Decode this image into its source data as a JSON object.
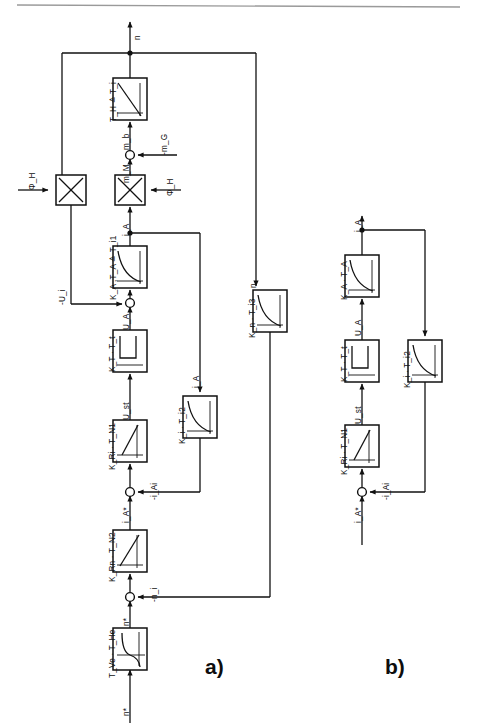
{
  "figure": {
    "type": "control-block-diagram",
    "background": "#ffffff",
    "line_color": "#111111",
    "top_rule": true
  },
  "panels": [
    {
      "id": "a",
      "label": "a)",
      "x": 205,
      "y": 667
    },
    {
      "id": "b",
      "label": "b)",
      "x": 385,
      "y": 667
    }
  ],
  "panel_a": {
    "blocks": [
      {
        "name": "block-th-ti",
        "label_parts": [
          "T",
          "H",
          " ≙ T",
          "i"
        ],
        "label": "T_H ≙ T_i",
        "curve": "falling-diagonal",
        "x": 113,
        "y": 78,
        "w": 34,
        "h": 42
      },
      {
        "name": "block-ka-ta",
        "label": "K_A ,T_A ≙ T_i1",
        "curve": "convex-decay",
        "x": 113,
        "y": 246,
        "w": 34,
        "h": 42
      },
      {
        "name": "block-kt-tt",
        "label": "K_T · T_t",
        "curve": "step-delay",
        "x": 113,
        "y": 330,
        "w": 34,
        "h": 42
      },
      {
        "name": "block-kri-tn1",
        "label": "K_Ri · T_N1",
        "curve": "rising-ramp",
        "x": 113,
        "y": 420,
        "w": 34,
        "h": 42
      },
      {
        "name": "block-krn-tn2",
        "label": "K_Rn · T_N2",
        "curve": "rising-ramp",
        "x": 113,
        "y": 530,
        "w": 34,
        "h": 42
      },
      {
        "name": "block-tve-the",
        "label": "T_Ve · T_He",
        "curve": "s-curve",
        "x": 113,
        "y": 628,
        "w": 34,
        "h": 42
      },
      {
        "name": "block-ki-ti2",
        "label": "K_i · T_i2",
        "curve": "convex-decay",
        "x": 183,
        "y": 396,
        "w": 34,
        "h": 42
      },
      {
        "name": "block-kn-ti3",
        "label": "K_n · T_i3",
        "curve": "convex-decay",
        "x": 253,
        "y": 290,
        "w": 34,
        "h": 42
      }
    ],
    "multipliers": [
      {
        "name": "multiplier-left",
        "glyph": "X",
        "x": 56,
        "y": 175,
        "size": 30
      },
      {
        "name": "multiplier-right",
        "glyph": "X",
        "x": 113,
        "y": 175,
        "size": 30
      }
    ],
    "junctions": [
      {
        "name": "sum-junction-torque",
        "x": 130,
        "y": 155
      },
      {
        "name": "sum-junction-voltage",
        "x": 130,
        "y": 303
      },
      {
        "name": "sum-junction-current",
        "x": 130,
        "y": 492
      },
      {
        "name": "sum-junction-speed",
        "x": 130,
        "y": 597
      }
    ],
    "signals": [
      {
        "name": "signal-n-output",
        "label": "n",
        "x": 136,
        "y": 32
      },
      {
        "name": "signal-mb",
        "label": "m_b",
        "x": 120,
        "y": 136
      },
      {
        "name": "signal-mg",
        "label": "-m_G",
        "x": 158,
        "y": 146
      },
      {
        "name": "signal-mm",
        "label": "m_M",
        "x": 120,
        "y": 168
      },
      {
        "name": "signal-phih-left",
        "label": "Φ_H",
        "x": 26,
        "y": 178
      },
      {
        "name": "signal-phih-right",
        "label": "Φ_H",
        "x": 163,
        "y": 183
      },
      {
        "name": "signal-ia-mult",
        "label": "i_A",
        "x": 120,
        "y": 222
      },
      {
        "name": "signal-ui-feedback",
        "label": "-U_i",
        "x": 56,
        "y": 291
      },
      {
        "name": "signal-ua",
        "label": "U_A",
        "x": 120,
        "y": 316
      },
      {
        "name": "signal-ust",
        "label": "U_st",
        "x": 120,
        "y": 404
      },
      {
        "name": "signal-iai",
        "label": "-i_Ai",
        "x": 150,
        "y": 485
      },
      {
        "name": "signal-ia-star",
        "label": "i_A*",
        "x": 120,
        "y": 508
      },
      {
        "name": "signal-ia-branch",
        "label": "i_A",
        "x": 176,
        "y": 375
      },
      {
        "name": "signal-ni",
        "label": "-n_i",
        "x": 150,
        "y": 588
      },
      {
        "name": "signal-n-star-mid",
        "label": "n*",
        "x": 120,
        "y": 612
      },
      {
        "name": "signal-n-star-input",
        "label": "n*",
        "x": 120,
        "y": 702
      },
      {
        "name": "signal-n-feedback",
        "label": "n",
        "x": 262,
        "y": 280
      }
    ]
  },
  "panel_b": {
    "blocks": [
      {
        "name": "block-ka-ta-b",
        "label": "K_A · T_A",
        "curve": "convex-decay",
        "x": 345,
        "y": 255,
        "w": 34,
        "h": 42
      },
      {
        "name": "block-kt-tt-b",
        "label": "K_T · T_t",
        "curve": "step-delay",
        "x": 345,
        "y": 340,
        "w": 34,
        "h": 42
      },
      {
        "name": "block-kri-tn1-b",
        "label": "K_Ri · T_N1",
        "curve": "rising-ramp",
        "x": 345,
        "y": 425,
        "w": 34,
        "h": 42
      },
      {
        "name": "block-ki-ti2-b",
        "label": "K_i · T_i2",
        "curve": "convex-decay",
        "x": 408,
        "y": 340,
        "w": 34,
        "h": 42
      }
    ],
    "junctions": [
      {
        "name": "sum-junction-current-b",
        "x": 362,
        "y": 492
      }
    ],
    "signals": [
      {
        "name": "signal-ia-output-b",
        "label": "i_A",
        "x": 352,
        "y": 222
      },
      {
        "name": "signal-ua-b",
        "label": "U_A",
        "x": 352,
        "y": 322
      },
      {
        "name": "signal-ust-b",
        "label": "U_st",
        "x": 352,
        "y": 408
      },
      {
        "name": "signal-iai-b",
        "label": "-i_Ai",
        "x": 382,
        "y": 485
      },
      {
        "name": "signal-ia-star-b",
        "label": "i_A*",
        "x": 352,
        "y": 508
      }
    ]
  }
}
